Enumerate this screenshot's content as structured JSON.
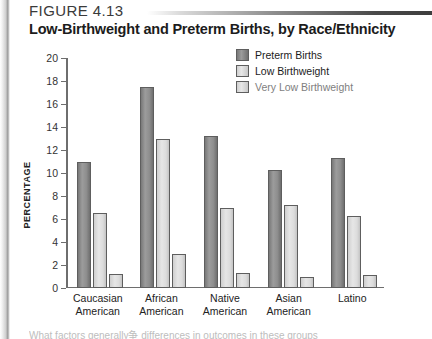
{
  "figure": {
    "number": "FIGURE 4.13",
    "title": "Low-Birthweight and Preterm Births, by Race/Ethnicity"
  },
  "footnote": "What factors generally争 differences in outcomes in these groups",
  "legend": {
    "items": [
      {
        "label": "Preterm Births",
        "color": "#8e8e8e"
      },
      {
        "label": "Low Birthweight",
        "color": "#dcdcdc"
      },
      {
        "label": "Very Low Birthweight",
        "color": "#dcdcdc"
      }
    ]
  },
  "chart_data": {
    "type": "bar",
    "title": "Low-Birthweight and Preterm Births, by Race/Ethnicity",
    "xlabel": "",
    "ylabel": "PERCENTAGE",
    "ylim": [
      0,
      20
    ],
    "ytick_step": 2,
    "yticks": [
      "0",
      "2",
      "4",
      "6",
      "8",
      "10",
      "12",
      "14",
      "16",
      "18",
      "20"
    ],
    "grid": false,
    "legend_position": "top-right",
    "categories": [
      "Caucasian American",
      "African American",
      "Native American",
      "Asian American",
      "Latino"
    ],
    "category_lines": [
      [
        "Caucasian",
        "American"
      ],
      [
        "African",
        "American"
      ],
      [
        "Native",
        "American"
      ],
      [
        "Asian",
        "American"
      ],
      [
        "Latino",
        ""
      ]
    ],
    "series": [
      {
        "name": "Preterm Births",
        "color": "#8e8e8e",
        "values": [
          11.0,
          17.5,
          13.2,
          10.3,
          11.3
        ]
      },
      {
        "name": "Low Birthweight",
        "color": "#dcdcdc",
        "values": [
          6.5,
          13.0,
          7.0,
          7.2,
          6.3
        ]
      },
      {
        "name": "Very Low Birthweight",
        "color": "#dcdcdc",
        "values": [
          1.2,
          3.0,
          1.3,
          1.0,
          1.15
        ]
      }
    ]
  }
}
